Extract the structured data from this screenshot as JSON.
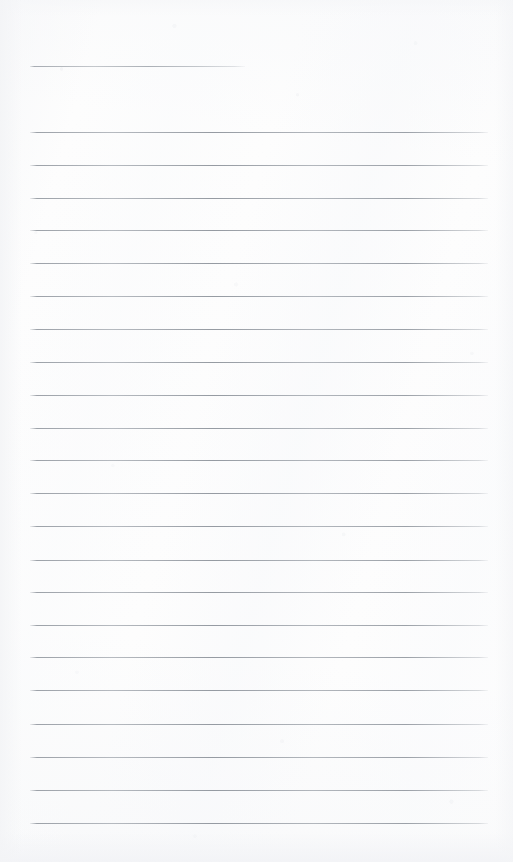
{
  "document": {
    "kind": "lined-notepad-page",
    "title": "",
    "body_text": "",
    "page_width": 513,
    "page_height": 862,
    "background_color": "#fdfdfd",
    "rule_color": "#8e949c"
  },
  "ruling": {
    "line_start_x": 30,
    "line_end_x": 488,
    "line_spacing": 32.7,
    "line_thickness": 1,
    "full_line_count": 23,
    "header_rule": {
      "label": "header-rule",
      "y": 66,
      "start_x": 30,
      "end_x": 245
    },
    "lines": [
      {
        "index": 1,
        "y": 132,
        "start_x": 30,
        "end_x": 488
      },
      {
        "index": 2,
        "y": 165,
        "start_x": 30,
        "end_x": 488
      },
      {
        "index": 3,
        "y": 198,
        "start_x": 30,
        "end_x": 488
      },
      {
        "index": 4,
        "y": 230,
        "start_x": 30,
        "end_x": 488
      },
      {
        "index": 5,
        "y": 263,
        "start_x": 30,
        "end_x": 488
      },
      {
        "index": 6,
        "y": 296,
        "start_x": 30,
        "end_x": 488
      },
      {
        "index": 7,
        "y": 329,
        "start_x": 30,
        "end_x": 488
      },
      {
        "index": 8,
        "y": 362,
        "start_x": 30,
        "end_x": 488
      },
      {
        "index": 9,
        "y": 395,
        "start_x": 30,
        "end_x": 488
      },
      {
        "index": 10,
        "y": 428,
        "start_x": 30,
        "end_x": 488
      },
      {
        "index": 11,
        "y": 460,
        "start_x": 30,
        "end_x": 488
      },
      {
        "index": 12,
        "y": 493,
        "start_x": 30,
        "end_x": 488
      },
      {
        "index": 13,
        "y": 526,
        "start_x": 30,
        "end_x": 488
      },
      {
        "index": 14,
        "y": 560,
        "start_x": 30,
        "end_x": 488
      },
      {
        "index": 15,
        "y": 592,
        "start_x": 30,
        "end_x": 488
      },
      {
        "index": 16,
        "y": 625,
        "start_x": 30,
        "end_x": 488
      },
      {
        "index": 17,
        "y": 657,
        "start_x": 30,
        "end_x": 488
      },
      {
        "index": 18,
        "y": 690,
        "start_x": 30,
        "end_x": 488
      },
      {
        "index": 19,
        "y": 724,
        "start_x": 30,
        "end_x": 488
      },
      {
        "index": 20,
        "y": 757,
        "start_x": 30,
        "end_x": 488
      },
      {
        "index": 21,
        "y": 790,
        "start_x": 30,
        "end_x": 488
      },
      {
        "index": 22,
        "y": 823,
        "start_x": 30,
        "end_x": 488
      }
    ]
  }
}
